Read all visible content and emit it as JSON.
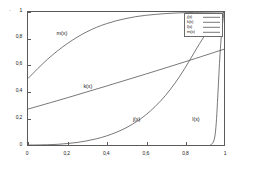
{
  "chart_data": {
    "type": "line",
    "title": "",
    "xlabel": "",
    "ylabel": "",
    "xlim": [
      0,
      1
    ],
    "ylim": [
      0,
      1
    ],
    "grid": false,
    "legend_position": "top-right",
    "xticks": [
      "0",
      "0,2",
      "0,4",
      "0,6",
      "0,8",
      "1"
    ],
    "xtick_values": [
      0,
      0.2,
      0.4,
      0.6,
      0.8,
      1
    ],
    "yticks": [
      "0",
      "0,2",
      "0,4",
      "0,6",
      "0,8",
      "1"
    ],
    "ytick_values": [
      0,
      0.2,
      0.4,
      0.6,
      0.8,
      1
    ],
    "series": [
      {
        "name": "j(x)",
        "label": "j(x)",
        "color": "#555555",
        "inline_label": "j(x)",
        "inline_label_x": 0.56,
        "inline_label_y": 0.21,
        "x": [
          0,
          0.05,
          0.1,
          0.15,
          0.2,
          0.25,
          0.3,
          0.35,
          0.4,
          0.45,
          0.5,
          0.55,
          0.6,
          0.65,
          0.7,
          0.75,
          0.8,
          0.85,
          0.9,
          0.95,
          1
        ],
        "values": [
          0,
          0.0004,
          0.002,
          0.005,
          0.011,
          0.019,
          0.031,
          0.047,
          0.068,
          0.095,
          0.129,
          0.172,
          0.225,
          0.291,
          0.37,
          0.465,
          0.576,
          0.7,
          0.82,
          0.92,
          1
        ]
      },
      {
        "name": "k(x)",
        "label": "k(x)",
        "color": "#555555",
        "inline_label": "k(x)",
        "inline_label_x": 0.31,
        "inline_label_y": 0.455,
        "x": [
          0,
          0.2,
          0.4,
          0.6,
          0.8,
          1
        ],
        "values": [
          0.27,
          0.355,
          0.443,
          0.533,
          0.625,
          0.72
        ]
      },
      {
        "name": "l(x)",
        "label": "l(x)",
        "color": "#555555",
        "inline_label": "l(x)",
        "inline_label_x": 0.86,
        "inline_label_y": 0.205,
        "x": [
          0.93,
          0.945,
          0.955,
          0.962,
          0.968,
          0.974,
          0.98,
          0.987,
          0.994,
          1
        ],
        "values": [
          0,
          0.02,
          0.08,
          0.2,
          0.36,
          0.53,
          0.69,
          0.83,
          0.93,
          1
        ]
      },
      {
        "name": "m(x)",
        "label": "m(x)",
        "color": "#555555",
        "inline_label": "m(x)",
        "inline_label_x": 0.175,
        "inline_label_y": 0.845,
        "x": [
          0,
          0.05,
          0.1,
          0.15,
          0.2,
          0.25,
          0.3,
          0.35,
          0.4,
          0.45,
          0.5,
          0.55,
          0.6,
          0.65,
          0.7,
          0.75,
          0.8,
          0.85,
          0.9,
          0.95,
          1
        ],
        "values": [
          0.5,
          0.575,
          0.645,
          0.707,
          0.762,
          0.81,
          0.851,
          0.885,
          0.912,
          0.934,
          0.951,
          0.965,
          0.975,
          0.982,
          0.988,
          0.992,
          0.995,
          0.997,
          0.998,
          0.999,
          1
        ]
      }
    ]
  },
  "legend": {
    "entries": [
      {
        "label": "j(x)"
      },
      {
        "label": "k(x)"
      },
      {
        "label": "l(x)"
      },
      {
        "label": "m(x)"
      }
    ]
  },
  "annotations": {
    "corner_mark": "·"
  }
}
